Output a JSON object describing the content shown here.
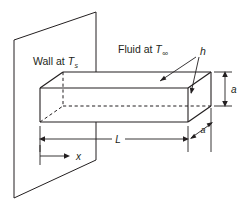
{
  "figure": {
    "background_color": "#ffffff",
    "line_color": "#231f20",
    "width": 245,
    "height": 211
  },
  "labels": {
    "wall": {
      "text": "Wall at ",
      "symbol": "T",
      "subscript": "s",
      "full": "Wall at Ts"
    },
    "fluid": {
      "text": "Fluid at ",
      "symbol": "T",
      "subscript": "∞",
      "full": "Fluid at T∞"
    },
    "coefficient": {
      "symbol": "h",
      "description": "convection heat transfer coefficient"
    }
  },
  "dimensions": {
    "length": {
      "symbol": "L",
      "orientation": "horizontal",
      "description": "fin length from wall to tip"
    },
    "height": {
      "symbol": "a",
      "orientation": "vertical",
      "description": "fin cross-section height"
    },
    "depth": {
      "symbol": "a",
      "orientation": "diagonal",
      "description": "fin cross-section depth"
    },
    "coordinate": {
      "symbol": "x",
      "orientation": "horizontal",
      "description": "axial coordinate measured from the wall"
    }
  },
  "geometry": {
    "wall": {
      "shape": "parallelogram",
      "points": "14,198 14,40 96,12 96,160"
    },
    "fin": {
      "shape": "rectangular-prism",
      "front_face": "40,88 40,122 188,122 188,88",
      "top_face": "40,88 63,72 211,72 188,88",
      "right_face": "188,88 211,72 211,106 188,122"
    }
  }
}
